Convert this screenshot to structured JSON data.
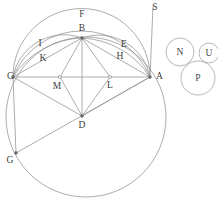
{
  "figure": {
    "kind": "euclidean-construction",
    "canvas": {
      "width": 218,
      "height": 203
    },
    "stroke_color": "#8a8a8a",
    "label_color": "#3c3c3c"
  },
  "points": [
    {
      "id": "A",
      "label": "A",
      "x": 150,
      "y": 77,
      "label_x": 156,
      "label_y": 77,
      "marked": true
    },
    {
      "id": "B",
      "label": "B",
      "x": 82,
      "y": 38,
      "label_x": 82,
      "label_y": 30,
      "marked": true
    },
    {
      "id": "C",
      "label": "C",
      "x": 13,
      "y": 77,
      "label_x": 6,
      "label_y": 77,
      "marked": true
    },
    {
      "id": "D",
      "label": "D",
      "x": 82,
      "y": 116,
      "label_x": 82,
      "label_y": 125,
      "marked": true
    },
    {
      "id": "E",
      "label": "E",
      "x": 123,
      "y": 45,
      "label_x": 123,
      "label_y": 45,
      "marked": false
    },
    {
      "id": "F",
      "label": "F",
      "x": 82,
      "y": 14,
      "label_x": 82,
      "label_y": 14,
      "marked": false
    },
    {
      "id": "G",
      "label": "G",
      "x": 16,
      "y": 153,
      "label_x": 9,
      "label_y": 161,
      "marked": true
    },
    {
      "id": "H",
      "label": "H",
      "x": 118,
      "y": 57,
      "label_x": 118,
      "label_y": 57,
      "marked": false
    },
    {
      "id": "I",
      "label": "I",
      "x": 40,
      "y": 44,
      "label_x": 40,
      "label_y": 44,
      "marked": false
    },
    {
      "id": "K",
      "label": "K",
      "x": 44,
      "y": 59,
      "label_x": 44,
      "label_y": 59,
      "marked": false
    },
    {
      "id": "L",
      "label": "L",
      "x": 110,
      "y": 77,
      "label_x": 110,
      "label_y": 85,
      "marked": true
    },
    {
      "id": "M",
      "label": "M",
      "x": 60,
      "y": 77,
      "label_x": 57,
      "label_y": 86,
      "marked": true
    },
    {
      "id": "S",
      "label": "S",
      "x": 153,
      "y": 3,
      "label_x": 154,
      "label_y": 7,
      "marked": false
    }
  ],
  "segments": [
    {
      "id": "CA",
      "from": "C",
      "to": "A"
    },
    {
      "id": "CB",
      "from": "C",
      "to": "B"
    },
    {
      "id": "BA",
      "from": "B",
      "to": "A"
    },
    {
      "id": "CD",
      "from": "C",
      "to": "D"
    },
    {
      "id": "DA",
      "from": "D",
      "to": "A"
    },
    {
      "id": "BD",
      "from": "B",
      "to": "D"
    },
    {
      "id": "BM",
      "from": "B",
      "to": "M"
    },
    {
      "id": "BL",
      "from": "B",
      "to": "L"
    },
    {
      "id": "MD",
      "from": "M",
      "to": "D"
    },
    {
      "id": "LD",
      "from": "L",
      "to": "D"
    },
    {
      "id": "CG",
      "from": "C",
      "to": "G"
    },
    {
      "id": "GD",
      "from": "G",
      "to": "D"
    },
    {
      "id": "GA",
      "from": "G",
      "to": "A"
    },
    {
      "id": "CK",
      "from": "C",
      "to": "B"
    },
    {
      "id": "SA",
      "from": "S",
      "to": "A"
    }
  ],
  "arcs": [
    {
      "id": "arc-F",
      "note": "large upper arc C to A through F"
    },
    {
      "id": "arc-I",
      "note": "arc C to B through I"
    },
    {
      "id": "arc-K",
      "note": "arc C to B through K"
    },
    {
      "id": "arc-E",
      "note": "arc B to A through E"
    },
    {
      "id": "arc-H",
      "note": "arc B to A through H"
    }
  ],
  "big_circle": {
    "id": "main-circle",
    "cx": 86,
    "cy": 117,
    "r": 80,
    "note": "large circle through C, G, A and bottom"
  },
  "small_circles": [
    {
      "id": "N",
      "label": "N",
      "cx": 180,
      "cy": 52,
      "r": 14
    },
    {
      "id": "U",
      "label": "U",
      "cx": 209,
      "cy": 53,
      "r": 10
    },
    {
      "id": "P",
      "label": "P",
      "cx": 198,
      "cy": 78,
      "r": 17
    }
  ]
}
